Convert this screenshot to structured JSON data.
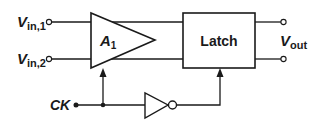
{
  "diagram": {
    "type": "block-diagram",
    "colors": {
      "stroke": "#1a1a1a",
      "background": "#ffffff"
    },
    "inputs": [
      {
        "id": "vin1",
        "label_main": "V",
        "label_sub": "in,1"
      },
      {
        "id": "vin2",
        "label_main": "V",
        "label_sub": "in,2"
      }
    ],
    "clock": {
      "label": "CK"
    },
    "amplifier": {
      "label_main": "A",
      "label_sub": "1"
    },
    "latch": {
      "label": "Latch"
    },
    "output": {
      "label_main": "V",
      "label_sub": "out"
    },
    "inverter": {
      "label": ""
    },
    "connections": [
      "Vin,1 -> A1 (+)",
      "Vin,2 -> A1 (-)",
      "A1 -> Latch (differential)",
      "CK -> A1 enable",
      "CK -> inverter -> Latch enable",
      "Latch -> Vout (differential)"
    ]
  }
}
